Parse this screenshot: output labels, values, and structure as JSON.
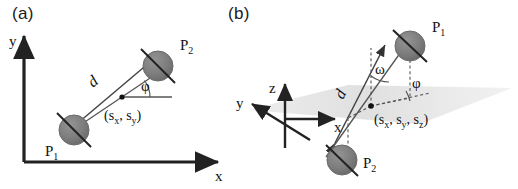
{
  "figure": {
    "background_color": "#ffffff",
    "stroke_color": "#333333",
    "sphere_fill": "#7a7a7a",
    "sphere_stroke": "#4d4d4d",
    "plane_fill": "#e2e2e2",
    "dashed_color": "#555555"
  },
  "panels": {
    "a": {
      "label": "(a)",
      "axes": {
        "x_label": "x",
        "y_label": "y"
      },
      "points": [
        {
          "id": "P1",
          "name": "P",
          "subscript": "1"
        },
        {
          "id": "P2",
          "name": "P",
          "subscript": "2"
        }
      ],
      "distance_label": "d",
      "angles": [
        {
          "id": "phi",
          "symbol": "φ"
        }
      ],
      "center_coordinate": {
        "open": "(",
        "s1": "s",
        "s1_sub": "x",
        "sep1": ", ",
        "s2": "s",
        "s2_sub": "y",
        "close": ")"
      }
    },
    "b": {
      "label": "(b)",
      "axes": {
        "x_label": "x",
        "y_label": "y",
        "z_label": "z"
      },
      "points": [
        {
          "id": "P1",
          "name": "P",
          "subscript": "1"
        },
        {
          "id": "P2",
          "name": "P",
          "subscript": "2"
        }
      ],
      "distance_label": "d",
      "angles": [
        {
          "id": "omega",
          "symbol": "ω"
        },
        {
          "id": "phi",
          "symbol": "φ"
        }
      ],
      "center_coordinate": {
        "open": "(",
        "s1": "s",
        "s1_sub": "x",
        "sep1": ", ",
        "s2": "s",
        "s2_sub": "y",
        "sep2": ", ",
        "s3": "s",
        "s3_sub": "z",
        "close": ")"
      }
    }
  }
}
